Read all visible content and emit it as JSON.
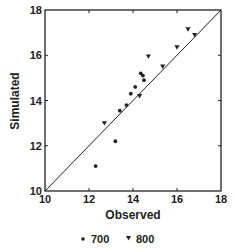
{
  "chart_data": {
    "type": "scatter",
    "title": "",
    "xlabel": "Observed",
    "ylabel": "Simulated",
    "xlim": [
      10,
      18
    ],
    "ylim": [
      10,
      18
    ],
    "xticks": [
      10,
      12,
      14,
      16,
      18
    ],
    "yticks": [
      10,
      12,
      14,
      16,
      18
    ],
    "grid": false,
    "reference_line": {
      "type": "1:1",
      "from": [
        10,
        10
      ],
      "to": [
        18,
        18
      ]
    },
    "legend_position": "bottom",
    "series": [
      {
        "name": "700",
        "marker": "dot",
        "points": [
          [
            12.3,
            11.1
          ],
          [
            13.2,
            12.2
          ],
          [
            13.4,
            13.55
          ],
          [
            13.7,
            13.8
          ],
          [
            13.9,
            14.3
          ],
          [
            14.1,
            14.6
          ],
          [
            14.5,
            14.9
          ],
          [
            14.45,
            15.1
          ],
          [
            14.35,
            15.2
          ]
        ]
      },
      {
        "name": "800",
        "marker": "triangle-down",
        "points": [
          [
            12.7,
            13.0
          ],
          [
            14.3,
            14.2
          ],
          [
            14.7,
            15.95
          ],
          [
            15.35,
            15.5
          ],
          [
            16.0,
            16.35
          ],
          [
            16.5,
            17.15
          ],
          [
            16.8,
            16.9
          ]
        ]
      }
    ]
  },
  "legend": {
    "items": [
      {
        "label": "700",
        "marker": "dot"
      },
      {
        "label": "800",
        "marker": "triangle-down"
      }
    ]
  },
  "colors": {
    "ink": "#222222",
    "background": "#ffffff"
  }
}
